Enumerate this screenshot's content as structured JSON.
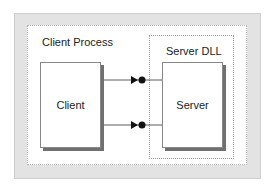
{
  "diagram": {
    "process_label": "Client Process",
    "dll_label": "Server DLL",
    "client_label": "Client",
    "server_label": "Server",
    "connections": [
      {
        "from": "Client",
        "to": "Server",
        "style": "arrow-to-interface-lollipop"
      },
      {
        "from": "Client",
        "to": "Server",
        "style": "arrow-to-interface-lollipop"
      }
    ],
    "colors": {
      "outer_frame": "#e3e3e3",
      "shadow": "#707070",
      "line": "#222222"
    }
  }
}
